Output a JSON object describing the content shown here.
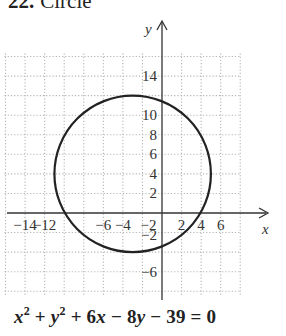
{
  "title": {
    "number": "22.",
    "label": "Circle"
  },
  "equation": {
    "text": "x^2 + y^2 + 6x − 8y − 39 = 0",
    "parts": {
      "x": "x",
      "exp": "2",
      "plus1": " + ",
      "y": "y",
      "plus2": " + 6",
      "x2": "x",
      "minus1": " − 8",
      "y2": "y",
      "tail": " − 39 = 0"
    }
  },
  "chart_data": {
    "type": "line",
    "subtitle": "x^2 + y^2 + 6x - 8y - 39 = 0",
    "xlabel": "x",
    "ylabel": "y",
    "xlim": [
      -16,
      8
    ],
    "ylim": [
      -8,
      16
    ],
    "grid": true,
    "grid_step": 2,
    "grid_style": "dotted",
    "x_tick_labels": [
      "-14",
      "-12",
      "-6",
      "-4",
      "-2",
      "2",
      "4",
      "6"
    ],
    "y_tick_labels": [
      "14",
      "10",
      "8",
      "6",
      "4",
      "2",
      "-2",
      "-6"
    ],
    "series": [
      {
        "name": "circle",
        "shape": "circle",
        "center": [
          -3,
          4
        ],
        "radius": 8,
        "color": "#222222"
      }
    ],
    "colors": {
      "curve": "#222222",
      "axis": "#333333",
      "grid": "#b5b5b5"
    }
  }
}
